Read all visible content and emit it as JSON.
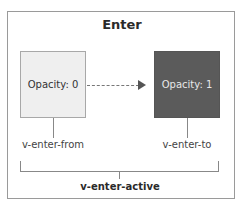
{
  "diagram": {
    "title": "Enter",
    "states": [
      {
        "id": "from",
        "label": "Opacity: 0",
        "fill": "#efefef",
        "text_color": "#333333"
      },
      {
        "id": "to",
        "label": "Opacity: 1",
        "fill": "#5b5b5b",
        "text_color": "#e8e8e8"
      }
    ],
    "arrow": {
      "from": "from",
      "to": "to",
      "style": "dashed"
    },
    "class_labels": {
      "from": "v-enter-from",
      "to": "v-enter-to",
      "active": "v-enter-active"
    },
    "colors": {
      "frame_border": "#9a9a9a",
      "connector": "#888888",
      "arrow_head": "#555555"
    }
  }
}
